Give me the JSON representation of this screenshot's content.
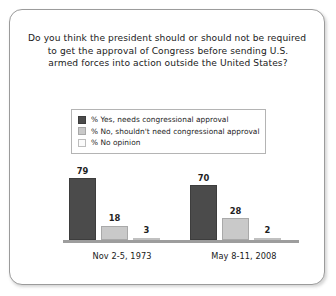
{
  "card": {
    "title_lines": [
      "Do you think the president should or should not be required",
      "to get the approval of Congress before sending U.S.",
      "armed forces into action outside the United States?"
    ]
  },
  "legend": {
    "items": [
      {
        "label": "% Yes, needs congressional approval",
        "color": "#4b4b4b",
        "swatch_name": "legend-swatch-yes"
      },
      {
        "label": "% No, shouldn't need congressional approval",
        "color": "#c9c9c9",
        "swatch_name": "legend-swatch-no"
      },
      {
        "label": "% No opinion",
        "color": "#fbfbfb",
        "swatch_name": "legend-swatch-no-opinion"
      }
    ]
  },
  "chart_data": {
    "type": "bar",
    "title": "Do you think the president should or should not be required to get the approval of Congress before sending U.S. armed forces into action outside the United States?",
    "xlabel": "",
    "ylabel": "",
    "ylim": [
      0,
      100
    ],
    "grid": false,
    "legend_position": "top-center",
    "categories": [
      "Nov 2-5, 1973",
      "May 8-11, 2008"
    ],
    "series": [
      {
        "name": "% Yes, needs congressional approval",
        "color": "#4b4b4b",
        "values": [
          79,
          70
        ]
      },
      {
        "name": "% No, shouldn't need congressional approval",
        "color": "#c9c9c9",
        "values": [
          18,
          28
        ]
      },
      {
        "name": "% No opinion",
        "color": "#fbfbfb",
        "values": [
          3,
          2
        ]
      }
    ],
    "value_labels": [
      [
        "79",
        "18",
        "3"
      ],
      [
        "70",
        "28",
        "2"
      ]
    ]
  }
}
